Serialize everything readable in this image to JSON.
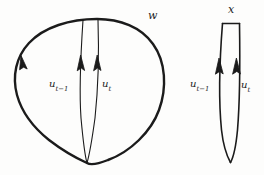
{
  "figure": {
    "caption_labels": {
      "outer_loop": "w",
      "right_loop": "x"
    },
    "path_labels": {
      "left_u_prev_base": "u",
      "left_u_prev_sub": "t−1",
      "left_u_base": "u",
      "left_u_sub": "t",
      "right_u_prev_base": "u",
      "right_u_prev_sub": "t−1",
      "right_u_base": "u",
      "right_u_sub": "t"
    },
    "colors": {
      "ink": "#1b1b1b",
      "background": "#fdfdfc"
    },
    "geometry": {
      "outer_loop_path": "M 97,19 C 128,21 150,33 161,54 C 172,75 167,103 152,126 C 137,149 112,163 87,163 C 66,163 45,150 31,131 C 17,112 13,90 17,70 C 21,50 34,34 54,26 C 66,21 81,18 97,19 Z",
      "left_inner_prev_path": "M 83,20 C 81,55 79,95 82,124 C 84,144 86,156 87,163",
      "left_inner_curr_path": "M 98,20 C 99,55 98,95 95,124 C 93,144 89,156 87,163",
      "right_outline_path": "M 223,23 C 220,60 219,100 222,128 C 224,146 228,158 230,162 C 233,157 237,145 238,127 C 240,99 240,58 239,23 Z",
      "right_top_segment": "M 223,23 L 239,23",
      "right_inner_prev_path": "M 220,60 C 220,95 221,125 222,140",
      "right_inner_curr_path": "M 237,60 C 237,95 236,125 235,140",
      "outer_arrow_tip": [
        21,
        56
      ],
      "left_arrow_prev_tip": [
        81,
        55
      ],
      "left_arrow_curr_tip": [
        97,
        55
      ],
      "right_arrow_prev_tip": [
        219,
        58
      ],
      "right_arrow_curr_tip": [
        236,
        58
      ]
    }
  }
}
